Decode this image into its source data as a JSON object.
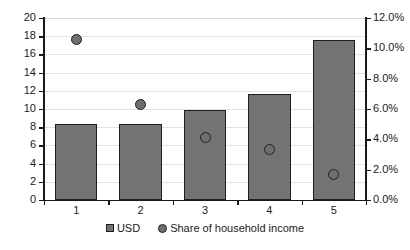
{
  "chart_data": {
    "type": "bar",
    "title": "",
    "subtitle": "",
    "xlabel": "",
    "ylabel": "",
    "categories": [
      "1",
      "2",
      "3",
      "4",
      "5"
    ],
    "grid": true,
    "legend_position": "bottom",
    "primary_axis": {
      "name": "USD",
      "ylim": [
        0,
        20
      ],
      "tick_step": 2,
      "ticks": [
        "0",
        "2",
        "4",
        "6",
        "8",
        "10",
        "12",
        "14",
        "16",
        "18",
        "20"
      ]
    },
    "secondary_axis": {
      "name": "Share of household income",
      "ylim": [
        0,
        12
      ],
      "tick_step": 2,
      "ticks": [
        "0.0%",
        "2.0%",
        "4.0%",
        "6.0%",
        "8.0%",
        "10.0%",
        "12.0%"
      ]
    },
    "series": [
      {
        "name": "USD",
        "type": "bar",
        "axis": "primary",
        "color": "#737373",
        "values": [
          8.35,
          8.4,
          9.9,
          11.6,
          17.6
        ]
      },
      {
        "name": "Share of household income",
        "type": "scatter",
        "axis": "secondary",
        "color": "#6e6e6e",
        "values": [
          10.6,
          6.3,
          4.1,
          3.3,
          1.65
        ]
      }
    ]
  },
  "legend": {
    "items": [
      {
        "label": "USD",
        "marker": "square-marker"
      },
      {
        "label": "Share of household income",
        "marker": "circle-marker"
      }
    ]
  }
}
